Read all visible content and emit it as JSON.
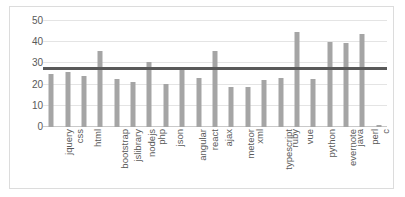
{
  "chart_data": {
    "type": "bar",
    "title": "",
    "subtitle": "",
    "xlabel": "",
    "ylabel": "",
    "ylim": [
      0,
      50
    ],
    "yticks": [
      0,
      10,
      20,
      30,
      40,
      50
    ],
    "grid": true,
    "legend": false,
    "legend_position": "none",
    "bar_color": "#a5a5a5",
    "reference_line": {
      "name": "average",
      "value": 27.5,
      "color": "#595959",
      "orientation": "horizontal"
    },
    "categories": [
      "jquery",
      "css",
      "html",
      "bootstrap",
      "jslibrary",
      "nodejs",
      "php",
      "json",
      "angular",
      "react",
      "ajax",
      "meteor",
      "xml",
      "typescript",
      "ruby",
      "vue",
      "python",
      "evernote",
      "java",
      "perl",
      "c"
    ],
    "values": [
      25,
      26,
      24,
      36,
      22.5,
      21,
      30.5,
      20.5,
      28.5,
      23,
      36,
      19,
      19,
      22,
      23,
      45,
      22.5,
      40,
      39.5,
      44,
      1
    ],
    "series": [
      {
        "name": "count",
        "values": [
          25,
          26,
          24,
          36,
          22.5,
          21,
          30.5,
          20.5,
          28.5,
          23,
          36,
          19,
          19,
          22,
          23,
          45,
          22.5,
          40,
          39.5,
          44,
          1
        ]
      }
    ]
  }
}
